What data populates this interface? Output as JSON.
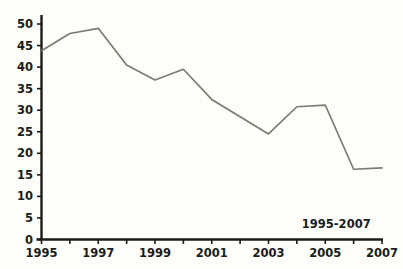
{
  "chart_data": {
    "type": "line",
    "title": "",
    "subtitle": "",
    "xlabel": "",
    "ylabel": "",
    "x": [
      1995,
      1996,
      1997,
      1998,
      1999,
      2000,
      2001,
      2002,
      2003,
      2004,
      2005,
      2006,
      2007
    ],
    "values": [
      43.8,
      47.8,
      49.0,
      40.5,
      37.0,
      39.5,
      32.5,
      28.5,
      24.5,
      30.8,
      31.2,
      16.3,
      16.6
    ],
    "series": [
      {
        "name": "",
        "values": [
          43.8,
          47.8,
          49.0,
          40.5,
          37.0,
          39.5,
          32.5,
          28.5,
          24.5,
          30.8,
          31.2,
          16.3,
          16.6
        ]
      }
    ],
    "xlim": [
      1995,
      2007
    ],
    "ylim": [
      0,
      50
    ],
    "y_ticks": [
      0,
      5,
      10,
      15,
      20,
      25,
      30,
      35,
      40,
      45,
      50
    ],
    "y_tick_labels": [
      "0",
      "5",
      "10",
      "15",
      "20",
      "25",
      "30",
      "35",
      "40",
      "45",
      "50"
    ],
    "x_ticks": [
      1995,
      1996,
      1997,
      1998,
      1999,
      2000,
      2001,
      2002,
      2003,
      2004,
      2005,
      2006,
      2007
    ],
    "x_tick_labels": [
      "1995",
      "",
      "1997",
      "",
      "1999",
      "",
      "2001",
      "",
      "2003",
      "",
      "2005",
      "",
      "2007"
    ],
    "x_tick_labels_visible": [
      "1995",
      "1997",
      "1999",
      "2001",
      "2003",
      "2005",
      "2007"
    ],
    "grid": false,
    "legend": null,
    "legend_position": "none",
    "annotations": [
      {
        "text": "1995-2007",
        "x": 2006.6,
        "y": 2.6,
        "position": "above-axis-right"
      }
    ],
    "colors": {
      "line": "#7d7b70",
      "axis": "#1b1b18",
      "text": "#1b1b18",
      "background": "#fdfdf9"
    }
  }
}
